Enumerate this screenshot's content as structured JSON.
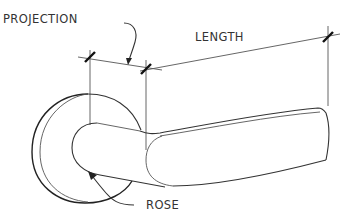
{
  "diagram": {
    "labels": {
      "projection": "PROJECTION",
      "length": "LENGTH",
      "rose": "ROSE"
    },
    "colors": {
      "line": "#333333",
      "background": "#ffffff"
    }
  }
}
